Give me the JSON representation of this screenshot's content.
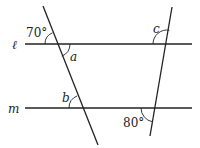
{
  "diagram": {
    "type": "parallel-lines-with-transversals",
    "lines": {
      "top": {
        "label": "ℓ"
      },
      "bottom": {
        "label": "m"
      }
    },
    "angles": {
      "top_left_given": "70°",
      "top_left_unknown": "a",
      "top_right_unknown": "c",
      "bottom_left_unknown": "b",
      "bottom_right_given": "80°"
    }
  }
}
